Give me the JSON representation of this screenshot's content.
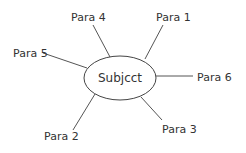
{
  "diagram": {
    "type": "mind-map",
    "center": {
      "label": "Subjcct",
      "shape": "ellipse",
      "cx": 120,
      "cy": 78,
      "rx": 36,
      "ry": 22
    },
    "branches": [
      {
        "id": "para-1",
        "label": "Para 1",
        "text_x": 156,
        "text_y": 21,
        "line": [
          163,
          25,
          145,
          59
        ]
      },
      {
        "id": "para-2",
        "label": "Para 2",
        "text_x": 44,
        "text_y": 140,
        "line": [
          73,
          130,
          95,
          94
        ]
      },
      {
        "id": "para-3",
        "label": "Para 3",
        "text_x": 162,
        "text_y": 133,
        "line": [
          162,
          120,
          141,
          97
        ]
      },
      {
        "id": "para-4",
        "label": "Para 4",
        "text_x": 71,
        "text_y": 21,
        "line": [
          93,
          25,
          110,
          57
        ]
      },
      {
        "id": "para-5",
        "label": "Para 5",
        "text_x": 13,
        "text_y": 57,
        "line": [
          43,
          53,
          87,
          68
        ]
      },
      {
        "id": "para-6",
        "label": "Para 6",
        "text_x": 197,
        "text_y": 81,
        "line": [
          156,
          76,
          193,
          76
        ]
      }
    ],
    "colors": {
      "background": "#ffffff",
      "text": "#333333",
      "line": "#555555",
      "ellipse_stroke": "#444444"
    }
  }
}
